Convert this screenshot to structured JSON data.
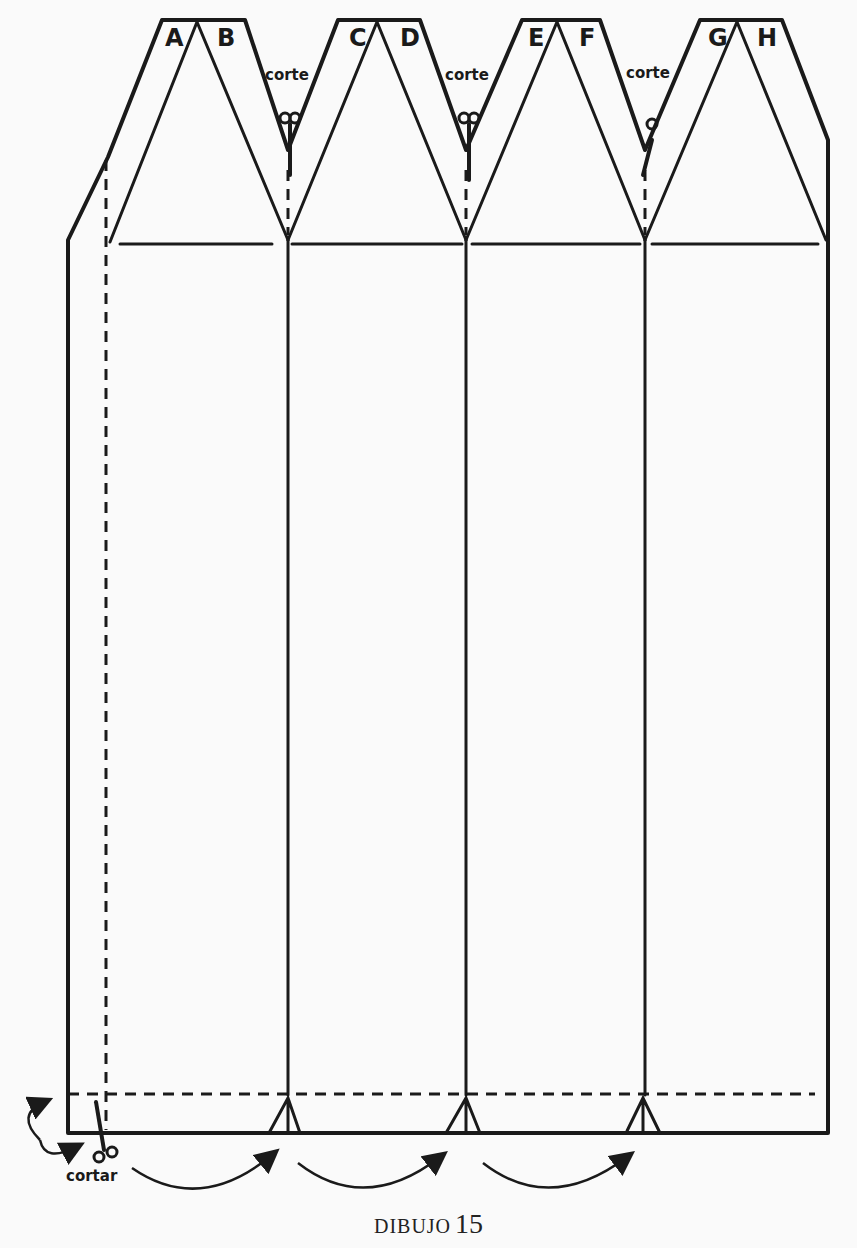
{
  "diagram": {
    "panel_labels": [
      "A",
      "B",
      "C",
      "D",
      "E",
      "F",
      "G",
      "H"
    ],
    "cut_labels": [
      "corte",
      "corte",
      "corte"
    ],
    "bottom_cut_label": "cortar",
    "caption": {
      "word": "DIBUJO",
      "number": "15"
    },
    "line_color": "#1a1a1a",
    "background": "#fafafa"
  }
}
